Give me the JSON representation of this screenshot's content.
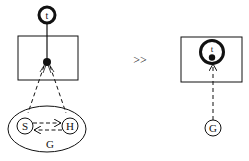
{
  "diagram": {
    "left": {
      "top_node": {
        "label": "t"
      },
      "group": {
        "label": "G",
        "nodes": [
          {
            "id": "S",
            "label": "S"
          },
          {
            "id": "H",
            "label": "H"
          }
        ],
        "edges": [
          {
            "from": "S",
            "to": "H",
            "style": "dashed"
          },
          {
            "from": "H",
            "to": "S",
            "style": "dashed"
          }
        ]
      }
    },
    "operator": ">>",
    "right": {
      "inner_node": {
        "label": "t"
      },
      "bottom_node": {
        "label": "G"
      }
    }
  },
  "colors": {
    "stroke": "#111111",
    "background": "#ffffff"
  }
}
